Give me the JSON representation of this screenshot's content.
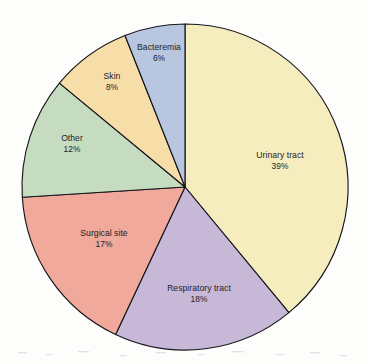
{
  "figure": {
    "background_color": "#fdfdfc",
    "outline_color": "#16161c",
    "label_color": "#1d1d2b"
  },
  "chart_data": {
    "type": "pie",
    "title": "",
    "xlabel": "",
    "ylabel": "",
    "legend": "none",
    "grid": false,
    "start_angle_deg": 0,
    "direction": "clockwise",
    "units": "percent",
    "center": {
      "x": 185,
      "y": 187
    },
    "radius": 163,
    "categories": [
      "Urinary tract",
      "Respiratory tract",
      "Surgical site",
      "Other",
      "Skin",
      "Bacteremia"
    ],
    "values": [
      39,
      18,
      17,
      12,
      8,
      6
    ],
    "colors": [
      "#f5edbe",
      "#c8b8d8",
      "#f0a99a",
      "#c5dcc0",
      "#f7dda8",
      "#b8c6e0"
    ],
    "slices": [
      {
        "label": "Urinary tract",
        "value": 39,
        "percent_text": "39%",
        "color": "#f5edbe",
        "label_x": 280,
        "label_y": 158
      },
      {
        "label": "Respiratory tract",
        "value": 18,
        "percent_text": "18%",
        "color": "#c8b8d8",
        "label_x": 199,
        "label_y": 291
      },
      {
        "label": "Surgical site",
        "value": 17,
        "percent_text": "17%",
        "color": "#f0a99a",
        "label_x": 104,
        "label_y": 236
      },
      {
        "label": "Other",
        "value": 12,
        "percent_text": "12%",
        "color": "#c5dcc0",
        "label_x": 72,
        "label_y": 141
      },
      {
        "label": "Skin",
        "value": 8,
        "percent_text": "8%",
        "color": "#f7dda8",
        "label_x": 112,
        "label_y": 79
      },
      {
        "label": "Bacteremia",
        "value": 6,
        "percent_text": "6%",
        "color": "#b8c6e0",
        "label_x": 159,
        "label_y": 50
      }
    ]
  }
}
